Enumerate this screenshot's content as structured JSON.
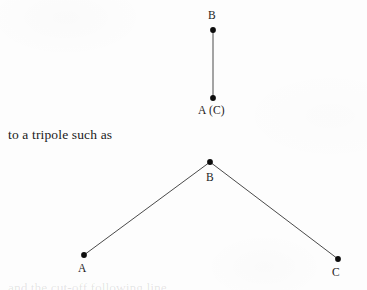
{
  "page": {
    "background_color": "#fdfdfd",
    "ink_color": "#1a1a1a",
    "line_color": "#4a4a4a",
    "dot_color": "#0d0d0d"
  },
  "body_text": {
    "line": "to a tripole such as"
  },
  "dipole_figure": {
    "caption_role": "dipole-diagram",
    "nodes": [
      {
        "id": "B",
        "label": "B",
        "x": 213,
        "y": 30,
        "label_x": 208,
        "label_y": 10
      },
      {
        "id": "AC",
        "label": "A (C)",
        "x": 213,
        "y": 98,
        "label_x": 198,
        "label_y": 105
      }
    ],
    "edges": [
      {
        "from": "B",
        "to": "AC"
      }
    ]
  },
  "tripole_figure": {
    "caption_role": "tripole-diagram",
    "nodes": [
      {
        "id": "B",
        "label": "B",
        "x": 210,
        "y": 162,
        "label_x": 206,
        "label_y": 172
      },
      {
        "id": "A",
        "label": "A",
        "x": 84,
        "y": 255,
        "label_x": 78,
        "label_y": 263
      },
      {
        "id": "C",
        "label": "C",
        "x": 338,
        "y": 259,
        "label_x": 332,
        "label_y": 267
      }
    ],
    "edges": [
      {
        "from": "A",
        "to": "B"
      },
      {
        "from": "B",
        "to": "C"
      }
    ]
  },
  "bottom_cut_line": {
    "text": "and the cut-off following line"
  }
}
